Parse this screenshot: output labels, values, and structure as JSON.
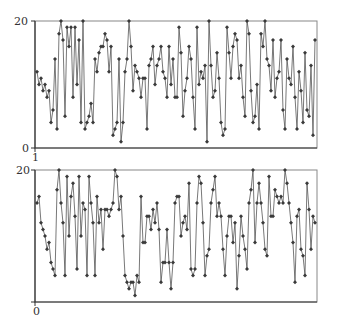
{
  "chart_data": [
    {
      "type": "line",
      "title": "",
      "xlabel": "",
      "ylabel": "",
      "ylim": [
        0,
        20
      ],
      "y_ticks": [
        "0",
        "20"
      ],
      "x_tick_label": "1",
      "grid": false,
      "legend": null,
      "marker": "diamond",
      "line_color": "#555555",
      "marker_color": "#444444",
      "values": [
        12,
        10,
        11,
        9,
        10,
        8,
        9,
        4,
        6,
        14,
        3,
        18,
        20,
        17,
        5,
        19,
        16,
        19,
        8,
        19,
        10,
        17,
        4,
        20,
        3,
        4,
        5,
        7,
        4,
        14,
        12,
        15,
        16,
        16,
        18,
        17,
        12,
        16,
        2,
        3,
        4,
        14,
        1,
        4,
        12,
        14,
        20,
        16,
        9,
        13,
        12,
        11,
        8,
        11,
        11,
        3,
        13,
        14,
        16,
        10,
        13,
        14,
        16,
        12,
        11,
        8,
        16,
        10,
        14,
        8,
        8,
        19,
        15,
        5,
        9,
        11,
        16,
        14,
        8,
        3,
        19,
        10,
        12,
        11,
        13,
        1,
        20,
        13,
        8,
        9,
        15,
        11,
        4,
        2,
        3,
        19,
        15,
        11,
        16,
        18,
        17,
        11,
        13,
        8,
        5,
        20,
        18,
        9,
        4,
        5,
        10,
        3,
        18,
        16,
        20,
        14,
        13,
        9,
        17,
        8,
        11,
        12,
        17,
        6,
        3,
        14,
        11,
        10,
        16,
        8,
        3,
        12,
        9,
        4,
        15,
        6,
        5,
        13,
        2,
        17
      ],
      "colors": {
        "line": "#555555",
        "marker": "#3a3a3a",
        "frame": "#888888",
        "axis": "#333333"
      }
    },
    {
      "type": "line",
      "title": "",
      "xlabel": "",
      "ylabel": "",
      "ylim": [
        0,
        20
      ],
      "y_ticks": [
        "20"
      ],
      "x_tick_label": "0",
      "grid": false,
      "legend": null,
      "marker": "diamond",
      "line_color": "#555555",
      "marker_color": "#444444",
      "values": [
        15,
        16,
        12,
        11,
        10,
        8,
        9,
        6,
        5,
        4,
        17,
        20,
        15,
        12,
        4,
        19,
        10,
        16,
        18,
        13,
        5,
        19,
        10,
        15,
        14,
        4,
        19,
        15,
        12,
        4,
        16,
        12,
        14,
        8,
        14,
        14,
        13,
        14,
        15,
        20,
        19,
        14,
        16,
        10,
        4,
        3,
        2,
        3,
        3,
        1,
        4,
        3,
        16,
        9,
        9,
        13,
        13,
        11,
        14,
        12,
        15,
        11,
        3,
        6,
        6,
        11,
        6,
        2,
        6,
        15,
        16,
        16,
        10,
        12,
        13,
        11,
        18,
        5,
        4,
        5,
        15,
        19,
        18,
        12,
        4,
        7,
        8,
        15,
        17,
        19,
        13,
        15,
        13,
        8,
        4,
        10,
        13,
        13,
        9,
        12,
        2,
        7,
        13,
        10,
        8,
        5,
        15,
        17,
        20,
        9,
        15,
        18,
        15,
        12,
        8,
        7,
        19,
        13,
        13,
        17,
        16,
        15,
        16,
        15,
        20,
        18,
        15,
        12,
        9,
        3,
        13,
        14,
        8,
        7,
        4,
        18,
        14,
        8,
        13,
        12
      ],
      "colors": {
        "line": "#555555",
        "marker": "#3a3a3a",
        "frame": "#888888",
        "axis": "#333333"
      }
    }
  ],
  "labels": {
    "top_y_max": "20",
    "top_y_min": "0",
    "top_x_start": "1",
    "bottom_y_max": "20",
    "bottom_x_start": "0"
  }
}
